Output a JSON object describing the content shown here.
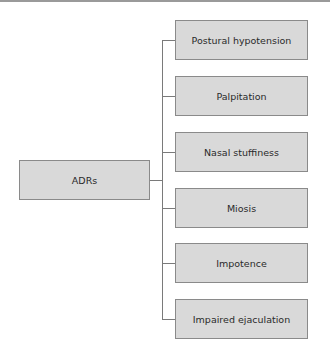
{
  "diagram": {
    "type": "tree",
    "root": {
      "label": "ADRs"
    },
    "children": [
      {
        "label": "Postural hypotension"
      },
      {
        "label": "Palpitation"
      },
      {
        "label": "Nasal stuffiness"
      },
      {
        "label": "Miosis"
      },
      {
        "label": "Impotence"
      },
      {
        "label": "Impaired ejaculation"
      }
    ],
    "colors": {
      "box_fill": "#d9d9d9",
      "box_border": "#8a8a8a",
      "connector": "#7a7a7a",
      "text": "#2a2a2a"
    }
  }
}
